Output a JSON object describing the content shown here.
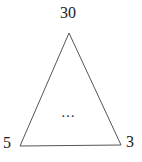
{
  "diagram": {
    "type": "triangle",
    "labels": {
      "top": "30",
      "bottom_left": "5",
      "bottom_right": "3",
      "center": "…"
    },
    "vertices": {
      "top": [
        69,
        33
      ],
      "bottom_left": [
        20,
        146
      ],
      "bottom_right": [
        121,
        145
      ]
    },
    "colors": {
      "stroke": "#555555",
      "text": "#1a1a1a",
      "background": "#ffffff"
    }
  }
}
